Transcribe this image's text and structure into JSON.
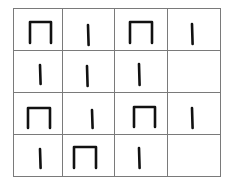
{
  "grid": {
    "rows": 4,
    "cols": 4,
    "col_edges": [
      13,
      62,
      114,
      167,
      220
    ],
    "row_edges": [
      8,
      50,
      92,
      134,
      176
    ],
    "line_color": "#7a7a7a",
    "symbol_color": "#111111"
  },
  "cells": [
    [
      {
        "symbol": "arch",
        "x1": 30,
        "x2": 51,
        "y1": 22,
        "y2": 43
      },
      {
        "symbol": "bar",
        "x": 88,
        "y1": 25,
        "y2": 45
      },
      {
        "symbol": "arch",
        "x1": 130,
        "x2": 152,
        "y1": 22,
        "y2": 43
      },
      {
        "symbol": "bar",
        "x": 192,
        "y1": 24,
        "y2": 44
      }
    ],
    [
      {
        "symbol": "bar",
        "x": 40,
        "y1": 65,
        "y2": 84
      },
      {
        "symbol": "bar",
        "x": 87,
        "y1": 66,
        "y2": 86
      },
      {
        "symbol": "bar",
        "x": 139,
        "y1": 64,
        "y2": 85
      },
      {
        "symbol": "empty"
      }
    ],
    [
      {
        "symbol": "arch",
        "x1": 28,
        "x2": 50,
        "y1": 108,
        "y2": 128
      },
      {
        "symbol": "bar",
        "x": 92,
        "y1": 110,
        "y2": 128
      },
      {
        "symbol": "arch",
        "x1": 134,
        "x2": 155,
        "y1": 107,
        "y2": 127
      },
      {
        "symbol": "bar",
        "x": 192,
        "y1": 108,
        "y2": 128
      }
    ],
    [
      {
        "symbol": "bar",
        "x": 40,
        "y1": 149,
        "y2": 168
      },
      {
        "symbol": "arch",
        "x1": 74,
        "x2": 96,
        "y1": 147,
        "y2": 168
      },
      {
        "symbol": "bar",
        "x": 139,
        "y1": 148,
        "y2": 168
      },
      {
        "symbol": "empty"
      }
    ]
  ]
}
